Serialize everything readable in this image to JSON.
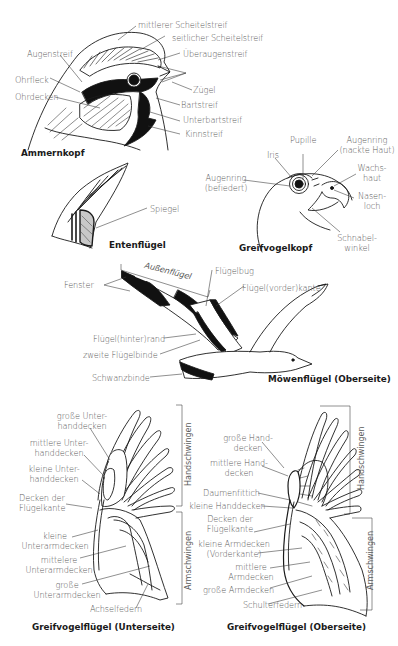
{
  "figures": {
    "ammernkopf": {
      "title": "Ammernkopf",
      "labels": {
        "mittlerer_scheitelstreif": "mittlerer Scheitelstreif",
        "seitlicher_scheitelstreif": "seitlicher Scheitelstreif",
        "augenstreif": "Augenstreif",
        "ueberaugenstreif": "Überaugenstreif",
        "ohrfleck": "Ohrfleck",
        "ohrdecken": "Ohrdecken",
        "zuegel": "Zügel",
        "bartstreif": "Bartstreif",
        "unterbartstreif": "Unterbartstreif",
        "kinnstreif": "Kinnstreif"
      }
    },
    "greifvogelkopf": {
      "title": "Greifvogelkopf",
      "labels": {
        "pupille": "Pupille",
        "iris": "Iris",
        "augenring_nackt_1": "Augenring",
        "augenring_nackt_2": "(nackte Haut)",
        "augenring_befiedert_1": "Augenring",
        "augenring_befiedert_2": "(befiedert)",
        "wachshaut_1": "Wachs-",
        "wachshaut_2": "haut",
        "nasenloch_1": "Nasen-",
        "nasenloch_2": "loch",
        "schnabelwinkel_1": "Schnabel-",
        "schnabelwinkel_2": "winkel"
      }
    },
    "entenfluegel": {
      "title": "Entenflügel",
      "labels": {
        "spiegel": "Spiegel"
      }
    },
    "moewenfluegel": {
      "title": "Möwenflügel (Oberseite)",
      "labels": {
        "aussenfluegel": "Außenflügel",
        "fluegelbug": "Flügelbug",
        "fenster": "Fenster",
        "fluegelvorderkante": "Flügel(vorder)kante",
        "fluegelhinterrand": "Flügel(hinter)rand",
        "zweite_fluegelbinde": "zweite Flügelbinde",
        "schwanzbinde": "Schwanzbinde"
      }
    },
    "greifvogelfluegel_unterseite": {
      "title": "Greifvogelflügel (Unterseite)",
      "labels": {
        "grosse_unterhanddecken_1": "große Unter-",
        "grosse_unterhanddecken_2": "handdecken",
        "mittlere_unterhanddecken_1": "mittlere Unter-",
        "mittlere_unterhanddecken_2": "handdecken",
        "kleine_unterhanddecken_1": "kleine Unter-",
        "kleine_unterhanddecken_2": "handdecken",
        "decken_fluegelkante_1": "Decken der",
        "decken_fluegelkante_2": "Flügelkante",
        "kleine_unterarmdecken_1": "kleine",
        "kleine_unterarmdecken_2": "Unterarmdecken",
        "mittlere_unterarmdecken_1": "mittelere",
        "mittlere_unterarmdecken_2": "Unterarmdecken",
        "grosse_unterarmdecken_1": "große",
        "grosse_unterarmdecken_2": "Unterarmdecken",
        "achselfedern": "Achselfedern",
        "handschwingen": "Handschwingen",
        "armschwingen": "Armschwingen"
      }
    },
    "greifvogelfluegel_oberseite": {
      "title": "Greifvogelflügel (Oberseite)",
      "labels": {
        "grosse_handdecken_1": "große Hand-",
        "grosse_handdecken_2": "decken",
        "mittlere_handdecken_1": "mittlere Hand-",
        "mittlere_handdecken_2": "decken",
        "daumenfittich": "Daumenfittich",
        "kleine_handdecken": "kleine Handdecken",
        "decken_fluegelkante_1": "Decken der",
        "decken_fluegelkante_2": "Flügelkante",
        "kleine_armdecken_1": "kleine Armdecken",
        "kleine_armdecken_2": "(Vorderkante)",
        "mittlere_armdecken_1": "mittlere",
        "mittlere_armdecken_2": "Armdecken",
        "grosse_armdecken": "große Armdecken",
        "schulterfedern": "Schulterfedern",
        "handschwingen": "Handschwingen",
        "armschwingen": "Armschwingen"
      }
    }
  },
  "colors": {
    "ink": "#1a1a1a",
    "label": "#5a5a5a",
    "leader": "#333333",
    "background": "#ffffff"
  }
}
